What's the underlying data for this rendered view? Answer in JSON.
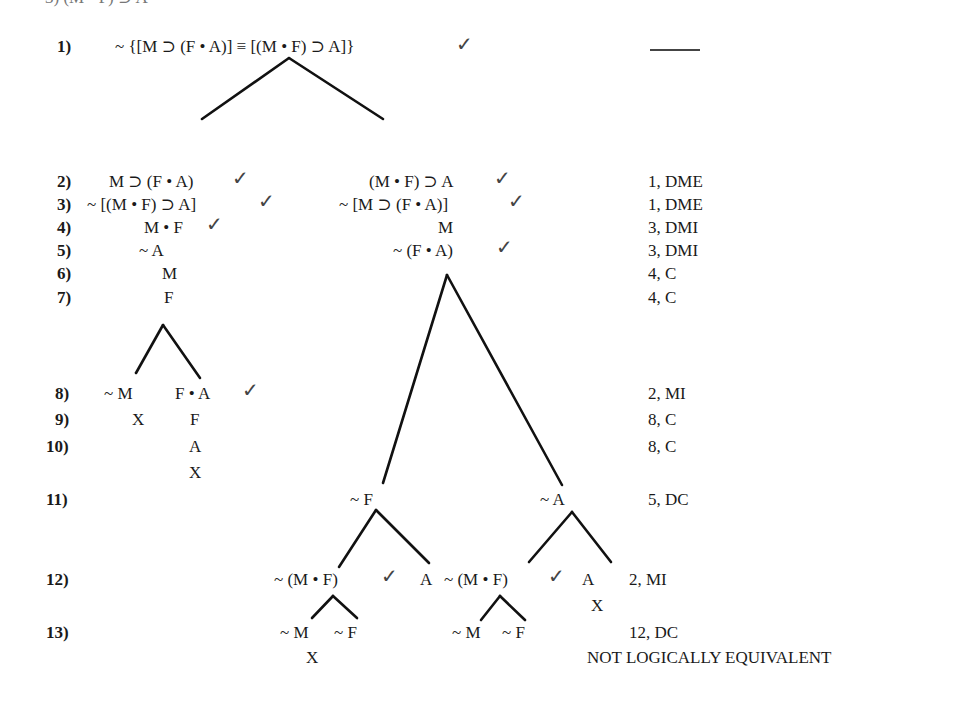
{
  "header_cut": "3) (M • F) ⊃ A",
  "rows": {
    "r1": {
      "num": "1)",
      "formula": "~ {[M ⊃ (F • A)] ≡ [(M • F) ⊃ A]}",
      "just": "——"
    },
    "r2": {
      "num": "2)",
      "left": "M ⊃ (F • A)",
      "right": "(M • F) ⊃ A",
      "just": "1, DME"
    },
    "r3": {
      "num": "3)",
      "left": "~ [(M • F) ⊃ A]",
      "right": "~ [M ⊃ (F • A)]",
      "just": "1, DME"
    },
    "r4": {
      "num": "4)",
      "left": "M • F",
      "right": "M",
      "just": "3, DMI"
    },
    "r5": {
      "num": "5)",
      "left": "~ A",
      "right": "~ (F • A)",
      "just": "3, DMI"
    },
    "r6": {
      "num": "6)",
      "left": "M",
      "just": "4, C"
    },
    "r7": {
      "num": "7)",
      "left": "F",
      "just": "4, C"
    },
    "r8": {
      "num": "8)",
      "a": "~ M",
      "b": "F • A",
      "just": "2, MI"
    },
    "r9": {
      "num": "9)",
      "a": "X",
      "b": "F",
      "just": "8, C"
    },
    "r10": {
      "num": "10)",
      "b": "A",
      "close": "X",
      "just": "8, C"
    },
    "r11": {
      "num": "11)",
      "a": "~ F",
      "b": "~ A",
      "just": "5, DC"
    },
    "r12": {
      "num": "12)",
      "a": "~ (M • F)",
      "b": "A",
      "c": "~ (M • F)",
      "d": "A",
      "close": "X",
      "just": "2, MI"
    },
    "r13": {
      "num": "13)",
      "a": "~ M",
      "b": "~ F",
      "c": "~ M",
      "d": "~ F",
      "close": "X",
      "just": "12, DC"
    }
  },
  "check": "✓",
  "conclusion": "NOT LOGICALLY EQUIVALENT"
}
